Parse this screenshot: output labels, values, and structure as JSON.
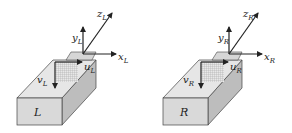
{
  "figure": {
    "panels": [
      {
        "id": "left",
        "box_label": "L",
        "axes": {
          "x": "x",
          "y": "y",
          "z": "z",
          "sub": "L"
        },
        "image_axes": {
          "u": "u",
          "v": "v",
          "sub": "L"
        }
      },
      {
        "id": "right",
        "box_label": "R",
        "axes": {
          "x": "x",
          "y": "y",
          "z": "z",
          "sub": "R"
        },
        "image_axes": {
          "u": "u",
          "v": "v",
          "sub": "R"
        }
      }
    ],
    "colors": {
      "front_face": "#d9d9d9",
      "top_face": "#e6e6e6",
      "side_face": "#bdbdbd",
      "edge": "#444444",
      "arrow": "#222222",
      "grid": "#9a9a9a"
    }
  }
}
